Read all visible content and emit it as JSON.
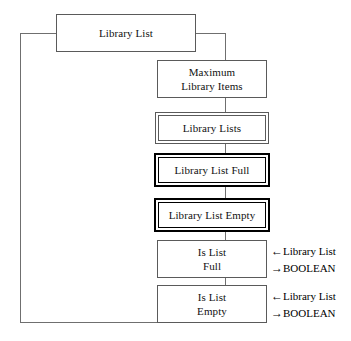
{
  "diagram": {
    "nodes": [
      {
        "id": "library-list",
        "label": "Library List",
        "line1": "Library List",
        "line2": "",
        "border": "single"
      },
      {
        "id": "maximum-library-items",
        "label": "Maximum Library Items",
        "line1": "Maximum",
        "line2": "Library Items",
        "border": "single"
      },
      {
        "id": "library-lists",
        "label": "Library Lists",
        "line1": "Library Lists",
        "line2": "",
        "border": "double-thin"
      },
      {
        "id": "library-list-full",
        "label": "Library List Full",
        "line1": "Library List Full",
        "line2": "",
        "border": "double-bold"
      },
      {
        "id": "library-list-empty",
        "label": "Library List Empty",
        "line1": "Library List Empty",
        "line2": "",
        "border": "double-bold"
      },
      {
        "id": "is-list-full",
        "label": "Is List Full",
        "line1": "Is List",
        "line2": "Full",
        "border": "single"
      },
      {
        "id": "is-list-empty",
        "label": "Is List Empty",
        "line1": "Is List",
        "line2": "Empty",
        "border": "single"
      }
    ],
    "annotations": [
      {
        "for": "is-list-full",
        "input_arrow": "←",
        "input_label": "Library List",
        "output_arrow": "→",
        "output_label": "BOOLEAN"
      },
      {
        "for": "is-list-empty",
        "input_arrow": "←",
        "input_label": "Library List",
        "output_arrow": "→",
        "output_label": "BOOLEAN"
      }
    ],
    "colors": {
      "line": "#6f6f6f",
      "box_border_thin": "#5a5a5a",
      "box_border_bold": "#000000",
      "text": "#111111",
      "background": "#ffffff"
    }
  }
}
